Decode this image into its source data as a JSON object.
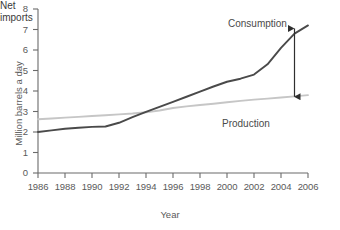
{
  "chart_data": {
    "type": "line",
    "title": "",
    "xlabel": "Year",
    "ylabel": "Million barrels a day",
    "xlim": [
      1986,
      2006
    ],
    "ylim": [
      0,
      8
    ],
    "grid": false,
    "legend_position": "inline-annotations",
    "xticks": [
      "1986",
      "1988",
      "1990",
      "1992",
      "1994",
      "1996",
      "1998",
      "2000",
      "2002",
      "2004",
      "2006"
    ],
    "yticks": [
      "0",
      "1",
      "2",
      "3",
      "4",
      "5",
      "6",
      "7",
      "8"
    ],
    "x": [
      1986,
      1987,
      1988,
      1989,
      1990,
      1991,
      1992,
      1993,
      1994,
      1995,
      1996,
      1997,
      1998,
      1999,
      2000,
      2001,
      2002,
      2003,
      2004,
      2005,
      2006
    ],
    "series": [
      {
        "name": "Consumption",
        "color": "#4a4a4a",
        "values": [
          2.0,
          2.08,
          2.16,
          2.21,
          2.25,
          2.27,
          2.45,
          2.72,
          2.98,
          3.23,
          3.47,
          3.72,
          3.97,
          4.22,
          4.45,
          4.6,
          4.8,
          5.3,
          6.1,
          6.8,
          7.2
        ]
      },
      {
        "name": "Production",
        "color": "#c6c6c6",
        "values": [
          2.62,
          2.66,
          2.7,
          2.74,
          2.78,
          2.82,
          2.86,
          2.9,
          2.96,
          3.05,
          3.17,
          3.25,
          3.32,
          3.38,
          3.45,
          3.52,
          3.58,
          3.63,
          3.68,
          3.74,
          3.8
        ]
      }
    ],
    "annotations": [
      {
        "name": "Consumption",
        "text": "Consumption"
      },
      {
        "name": "Production",
        "text": "Production"
      },
      {
        "name": "Net imports",
        "text_line1": "Net",
        "text_line2": "imports",
        "at_year": 2005,
        "from_value": 7.05,
        "to_value": 3.72
      }
    ]
  },
  "axis": {
    "y_title": "Million barrels a day",
    "x_title": "Year"
  },
  "colors": {
    "consumption": "#4a4a4a",
    "production": "#c6c6c6",
    "axis": "#6b6b6b",
    "text": "#555555"
  }
}
